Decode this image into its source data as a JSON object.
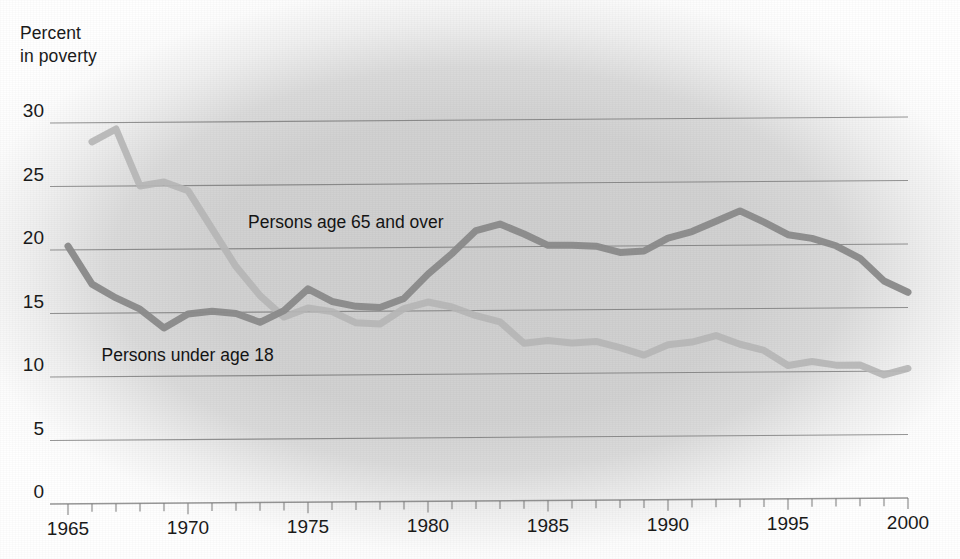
{
  "chart_data": {
    "type": "line",
    "title": "",
    "subtitle": "",
    "ylabel": "Percent\nin poverty",
    "ylabel_line1": "Percent",
    "ylabel_line2": "in poverty",
    "xlabel": "",
    "xlim": [
      1965,
      2000
    ],
    "ylim": [
      0,
      30
    ],
    "grid": true,
    "legend_position": "inline-annotation",
    "y_ticks": [
      0,
      5,
      10,
      15,
      20,
      25,
      30
    ],
    "y_tick_labels": [
      "0",
      "5",
      "10",
      "15",
      "20",
      "25",
      "30"
    ],
    "x_ticks": [
      1965,
      1970,
      1975,
      1980,
      1985,
      1990,
      1995,
      2000
    ],
    "x_tick_labels": [
      "1965",
      "1970",
      "1975",
      "1980",
      "1985",
      "1990",
      "1995",
      "2000"
    ],
    "x_minor_tick_interval": 1,
    "x": [
      1965,
      1966,
      1967,
      1968,
      1969,
      1970,
      1971,
      1972,
      1973,
      1974,
      1975,
      1976,
      1977,
      1978,
      1979,
      1980,
      1981,
      1982,
      1983,
      1984,
      1985,
      1986,
      1987,
      1988,
      1989,
      1990,
      1991,
      1992,
      1993,
      1994,
      1995,
      1996,
      1997,
      1998,
      1999,
      2000
    ],
    "series": [
      {
        "name": "Persons age 65 and over",
        "color": "#b5b5b5",
        "values": [
          null,
          28.5,
          29.5,
          25.0,
          25.3,
          24.6,
          21.6,
          18.6,
          16.3,
          14.6,
          15.3,
          15.0,
          14.1,
          14.0,
          15.2,
          15.7,
          15.3,
          14.6,
          14.1,
          12.4,
          12.6,
          12.4,
          12.5,
          12.0,
          11.4,
          12.2,
          12.4,
          12.9,
          12.2,
          11.7,
          10.5,
          10.8,
          10.5,
          10.5,
          9.7,
          10.2
        ]
      },
      {
        "name": "Persons under age 18",
        "color": "#8a8a8a",
        "values": [
          20.3,
          17.3,
          16.2,
          15.3,
          13.8,
          14.9,
          15.1,
          14.9,
          14.2,
          15.1,
          16.8,
          15.8,
          15.4,
          15.3,
          16.0,
          17.9,
          19.5,
          21.3,
          21.8,
          21.0,
          20.1,
          20.1,
          20.0,
          19.5,
          19.6,
          20.6,
          21.1,
          21.9,
          22.7,
          21.8,
          20.8,
          20.5,
          19.9,
          18.9,
          17.1,
          16.2
        ]
      }
    ],
    "annotations": [
      {
        "text": "Persons age 65 and over",
        "x": 1972.5,
        "y": 22.0
      },
      {
        "text": "Persons under age 18",
        "x": 1966.4,
        "y": 11.6
      }
    ],
    "colors": {
      "background": "#d3d3d3",
      "page": "#ffffff",
      "gridline": "#6e6e6e",
      "text": "#1a1a1a",
      "series_65_plus": "#b5b5b5",
      "series_under_18": "#8a8a8a"
    }
  },
  "geometry": {
    "plot_left": 68,
    "plot_right": 908,
    "plot_top": 117,
    "plot_bottom": 498
  }
}
